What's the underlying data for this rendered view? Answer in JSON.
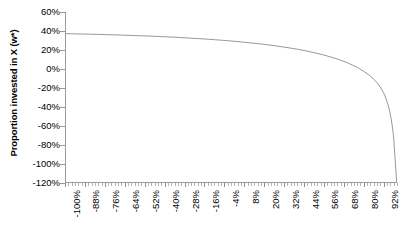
{
  "chart_data": {
    "type": "line",
    "title": "",
    "subtitle": "",
    "xlabel": "",
    "ylabel": "Proportion invested in X (w*)",
    "xlim": [
      -1.0,
      1.0
    ],
    "ylim": [
      -1.2,
      0.6
    ],
    "grid": false,
    "legend": false,
    "legend_position": "none",
    "y_tick_labels": [
      "60%",
      "40%",
      "20%",
      "0%",
      "-20%",
      "-40%",
      "-60%",
      "-80%",
      "-100%",
      "-120%"
    ],
    "y_tick_values": [
      60,
      40,
      20,
      0,
      -20,
      -40,
      -60,
      -80,
      -100,
      -120
    ],
    "x_tick_labels": [
      "-100%",
      "-88%",
      "-76%",
      "-64%",
      "-52%",
      "-40%",
      "-28%",
      "-16%",
      "-4%",
      "8%",
      "20%",
      "32%",
      "44%",
      "56%",
      "68%",
      "80%",
      "92%"
    ],
    "x_tick_values": [
      -100,
      -88,
      -76,
      -64,
      -52,
      -40,
      -28,
      -16,
      -4,
      8,
      20,
      32,
      44,
      56,
      68,
      80,
      92
    ],
    "series": [
      {
        "name": "Optimal weight in X",
        "color": "#8c8c8c",
        "x": [
          -100,
          -95,
          -90,
          -85,
          -80,
          -75,
          -70,
          -65,
          -60,
          -55,
          -50,
          -45,
          -40,
          -35,
          -30,
          -25,
          -20,
          -15,
          -10,
          -5,
          0,
          5,
          10,
          15,
          20,
          25,
          30,
          35,
          40,
          45,
          50,
          55,
          60,
          65,
          70,
          75,
          80,
          83,
          86,
          88,
          90,
          92,
          94,
          95,
          96,
          97,
          97.5,
          98
        ],
        "y": [
          37.2,
          37.0,
          36.8,
          36.6,
          36.4,
          36.1,
          35.9,
          35.6,
          35.3,
          35.0,
          34.7,
          34.3,
          33.9,
          33.5,
          33.0,
          32.5,
          32.0,
          31.4,
          30.8,
          30.1,
          29.4,
          28.6,
          27.7,
          26.8,
          25.8,
          24.7,
          23.4,
          22.1,
          20.6,
          18.9,
          17.0,
          14.9,
          12.4,
          9.6,
          6.2,
          2.1,
          -3.1,
          -7.0,
          -11.8,
          -15.8,
          -20.8,
          -27.6,
          -37.5,
          -44.5,
          -53.5,
          -66.0,
          -75.0,
          -88.0
        ]
      }
    ]
  },
  "axis": {
    "y_title": "Proportion invested in X (w*)"
  }
}
